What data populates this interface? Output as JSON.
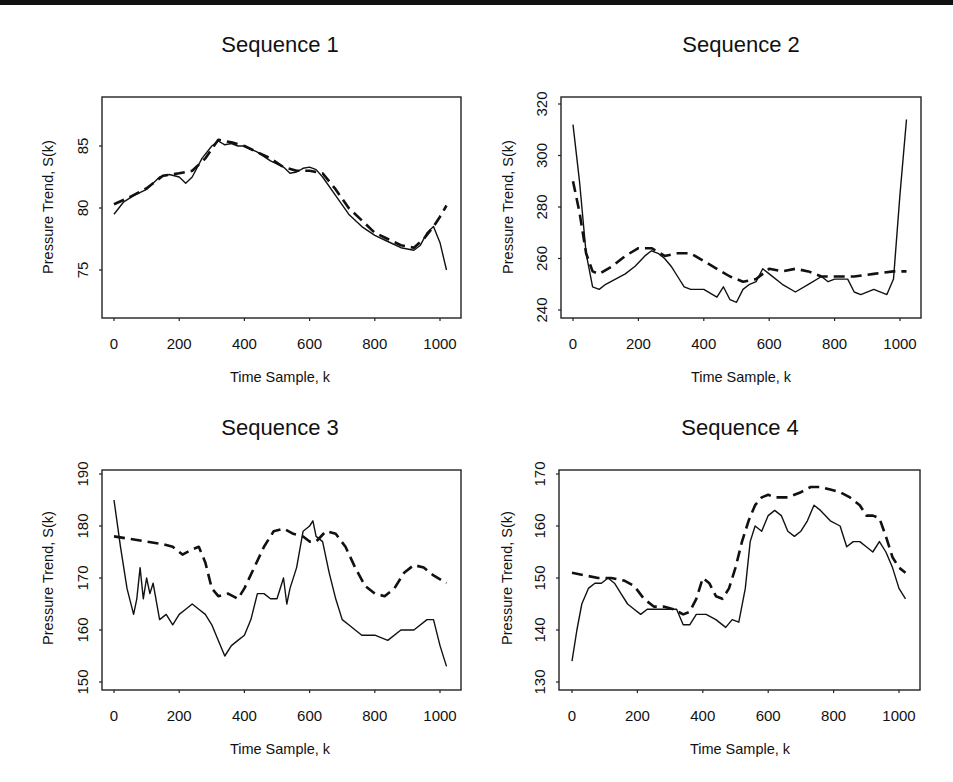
{
  "figure": {
    "panels": [
      {
        "id": "seq1",
        "title": "Sequence 1",
        "xlabel": "Time Sample, k",
        "ylabel": "Pressure Trend, S(k)",
        "xticks": [
          "0",
          "200",
          "400",
          "600",
          "800",
          "1000"
        ],
        "yticks": [
          "75",
          "80",
          "85"
        ]
      },
      {
        "id": "seq2",
        "title": "Sequence 2",
        "xlabel": "Time Sample, k",
        "ylabel": "Pressure Trend, S(k)",
        "xticks": [
          "0",
          "200",
          "400",
          "600",
          "800",
          "1000"
        ],
        "yticks": [
          "240",
          "260",
          "280",
          "300",
          "320"
        ]
      },
      {
        "id": "seq3",
        "title": "Sequence 3",
        "xlabel": "Time Sample, k",
        "ylabel": "Pressure Trend, S(k)",
        "xticks": [
          "0",
          "200",
          "400",
          "600",
          "800",
          "1000"
        ],
        "yticks": [
          "150",
          "160",
          "170",
          "180",
          "190"
        ]
      },
      {
        "id": "seq4",
        "title": "Sequence 4",
        "xlabel": "Time Sample, k",
        "ylabel": "Pressure Trend, S(k)",
        "xticks": [
          "0",
          "200",
          "400",
          "600",
          "800",
          "1000"
        ],
        "yticks": [
          "130",
          "140",
          "150",
          "160",
          "170"
        ]
      }
    ]
  },
  "chart_data": [
    {
      "type": "line",
      "title": "Sequence 1",
      "xlabel": "Time Sample, k",
      "ylabel": "Pressure Trend, S(k)",
      "xlim": [
        -30,
        1060
      ],
      "ylim": [
        71,
        89
      ],
      "xticks": [
        0,
        200,
        400,
        600,
        800,
        1000
      ],
      "yticks": [
        75,
        80,
        85
      ],
      "grid": false,
      "legend": "none",
      "series": [
        {
          "name": "solid",
          "style": "solid",
          "x": [
            0,
            30,
            60,
            100,
            140,
            170,
            200,
            220,
            240,
            270,
            300,
            320,
            340,
            360,
            380,
            400,
            440,
            480,
            520,
            540,
            560,
            580,
            600,
            620,
            640,
            680,
            720,
            760,
            800,
            840,
            880,
            920,
            940,
            960,
            980,
            1000,
            1020
          ],
          "y": [
            79.5,
            80.5,
            81.0,
            81.5,
            82.5,
            82.7,
            82.5,
            82.0,
            82.5,
            84.0,
            85.0,
            85.4,
            85.1,
            85.2,
            85.0,
            85.0,
            84.5,
            83.8,
            83.3,
            82.8,
            82.9,
            83.2,
            83.3,
            83.1,
            82.5,
            81.0,
            79.5,
            78.5,
            77.8,
            77.3,
            76.8,
            76.6,
            77.0,
            78.0,
            78.5,
            77.2,
            75.0
          ]
        },
        {
          "name": "dashed",
          "style": "dashed",
          "x": [
            0,
            50,
            100,
            150,
            200,
            240,
            280,
            320,
            360,
            400,
            440,
            480,
            520,
            560,
            600,
            640,
            680,
            720,
            760,
            800,
            840,
            880,
            920,
            950,
            980,
            1000,
            1020
          ],
          "y": [
            80.3,
            80.9,
            81.6,
            82.6,
            82.8,
            83.0,
            84.0,
            85.5,
            85.3,
            85.0,
            84.5,
            84.0,
            83.3,
            83.0,
            83.0,
            82.8,
            81.5,
            80.0,
            79.0,
            78.0,
            77.5,
            77.0,
            76.8,
            77.5,
            78.5,
            79.3,
            80.2
          ]
        }
      ]
    },
    {
      "type": "line",
      "title": "Sequence 2",
      "xlabel": "Time Sample, k",
      "ylabel": "Pressure Trend, S(k)",
      "xlim": [
        -30,
        1060
      ],
      "ylim": [
        236,
        323
      ],
      "xticks": [
        0,
        200,
        400,
        600,
        800,
        1000
      ],
      "yticks": [
        240,
        260,
        280,
        300,
        320
      ],
      "grid": false,
      "legend": "none",
      "series": [
        {
          "name": "solid",
          "style": "solid",
          "x": [
            0,
            20,
            40,
            60,
            80,
            100,
            130,
            160,
            190,
            220,
            240,
            260,
            280,
            300,
            320,
            340,
            360,
            400,
            440,
            460,
            480,
            500,
            520,
            540,
            560,
            580,
            600,
            640,
            680,
            720,
            760,
            780,
            800,
            840,
            860,
            880,
            920,
            960,
            980,
            1000,
            1020
          ],
          "y": [
            312,
            290,
            262,
            249,
            248,
            250,
            252,
            254,
            257,
            261,
            263,
            262,
            260,
            257,
            253,
            249,
            248,
            248,
            245,
            249,
            244,
            243,
            248,
            250,
            251,
            256,
            254,
            250,
            247,
            250,
            253,
            251,
            252,
            252,
            247,
            246,
            248,
            246,
            252,
            285,
            314
          ]
        },
        {
          "name": "dashed",
          "style": "dashed",
          "x": [
            0,
            20,
            40,
            60,
            80,
            120,
            160,
            200,
            240,
            280,
            320,
            360,
            400,
            440,
            480,
            520,
            560,
            600,
            640,
            680,
            720,
            760,
            800,
            860,
            920,
            980,
            1020
          ],
          "y": [
            290,
            278,
            262,
            255,
            254,
            257,
            261,
            264,
            264,
            261,
            262,
            262,
            259,
            256,
            253,
            251,
            252,
            256,
            255,
            256,
            255,
            253,
            253,
            253,
            254,
            255,
            255
          ]
        }
      ]
    },
    {
      "type": "line",
      "title": "Sequence 3",
      "xlabel": "Time Sample, k",
      "ylabel": "Pressure Trend, S(k)",
      "xlim": [
        -30,
        1060
      ],
      "ylim": [
        148,
        192
      ],
      "xticks": [
        0,
        200,
        400,
        600,
        800,
        1000
      ],
      "yticks": [
        150,
        160,
        170,
        180,
        190
      ],
      "grid": false,
      "legend": "none",
      "series": [
        {
          "name": "solid",
          "style": "solid",
          "x": [
            0,
            20,
            40,
            60,
            70,
            80,
            90,
            100,
            110,
            120,
            140,
            160,
            180,
            200,
            220,
            240,
            260,
            280,
            300,
            320,
            340,
            360,
            380,
            400,
            420,
            440,
            460,
            480,
            500,
            520,
            530,
            540,
            560,
            580,
            600,
            610,
            620,
            640,
            660,
            680,
            700,
            720,
            760,
            800,
            840,
            880,
            920,
            960,
            980,
            1000,
            1020
          ],
          "y": [
            185,
            176,
            168,
            163,
            166,
            172,
            166,
            170,
            167,
            169,
            162,
            163,
            161,
            163,
            164,
            165,
            164,
            163,
            161,
            158,
            155,
            157,
            158,
            159,
            162,
            167,
            167,
            166,
            166,
            170,
            165,
            168,
            172,
            179,
            180,
            181,
            178,
            177,
            171,
            166,
            162,
            161,
            159,
            159,
            158,
            160,
            160,
            162,
            162,
            157,
            153
          ]
        },
        {
          "name": "dashed",
          "style": "dashed",
          "x": [
            0,
            50,
            100,
            150,
            180,
            210,
            240,
            260,
            280,
            300,
            320,
            350,
            380,
            400,
            430,
            460,
            490,
            520,
            550,
            580,
            600,
            620,
            650,
            680,
            710,
            740,
            770,
            800,
            830,
            860,
            890,
            920,
            950,
            980,
            1020
          ],
          "y": [
            178,
            177.5,
            177,
            176.5,
            176,
            174.5,
            175.5,
            176,
            173,
            168,
            166.5,
            167,
            166,
            168,
            172,
            176,
            179,
            179.5,
            178.5,
            178,
            177,
            177,
            179,
            178.5,
            176,
            172,
            168.5,
            167,
            166.5,
            168,
            171,
            172.5,
            172,
            170.5,
            169
          ]
        }
      ]
    },
    {
      "type": "line",
      "title": "Sequence 4",
      "xlabel": "Time Sample, k",
      "ylabel": "Pressure Trend, S(k)",
      "xlim": [
        -30,
        1060
      ],
      "ylim": [
        128,
        172
      ],
      "xticks": [
        0,
        200,
        400,
        600,
        800,
        1000
      ],
      "yticks": [
        130,
        140,
        150,
        160,
        170
      ],
      "grid": false,
      "legend": "none",
      "series": [
        {
          "name": "solid",
          "style": "solid",
          "x": [
            0,
            15,
            30,
            50,
            70,
            90,
            110,
            130,
            150,
            170,
            190,
            210,
            230,
            260,
            290,
            320,
            340,
            360,
            380,
            410,
            440,
            470,
            490,
            510,
            530,
            545,
            560,
            580,
            600,
            620,
            640,
            660,
            680,
            700,
            720,
            740,
            760,
            790,
            820,
            840,
            860,
            880,
            900,
            920,
            940,
            960,
            980,
            1000,
            1020
          ],
          "y": [
            134,
            140,
            145,
            148,
            149,
            149,
            150,
            149,
            147,
            145,
            144,
            143,
            144,
            144,
            144,
            144,
            141,
            141,
            143,
            143,
            142,
            140.5,
            142,
            141.5,
            148,
            157,
            160,
            159,
            162,
            163,
            162,
            159,
            158,
            159,
            161,
            164,
            163,
            161,
            160,
            156,
            157,
            157,
            156,
            155,
            157,
            155,
            152,
            148,
            146
          ]
        },
        {
          "name": "dashed",
          "style": "dashed",
          "x": [
            0,
            40,
            80,
            120,
            160,
            190,
            220,
            250,
            280,
            310,
            340,
            360,
            380,
            400,
            420,
            440,
            460,
            480,
            500,
            520,
            540,
            560,
            580,
            600,
            620,
            640,
            660,
            680,
            700,
            730,
            760,
            790,
            820,
            850,
            880,
            900,
            920,
            940,
            960,
            980,
            1000,
            1020
          ],
          "y": [
            151,
            150.5,
            150,
            150,
            149.5,
            148.5,
            146,
            144.5,
            144.5,
            144,
            143,
            143.5,
            146,
            150,
            149,
            146.5,
            146,
            148,
            152,
            157,
            161,
            164,
            165.5,
            166,
            165.5,
            165.5,
            165.5,
            166,
            166.5,
            167.5,
            167.5,
            167,
            166.5,
            165.5,
            164,
            162,
            162,
            161.5,
            158,
            154,
            152,
            151
          ]
        }
      ]
    }
  ]
}
